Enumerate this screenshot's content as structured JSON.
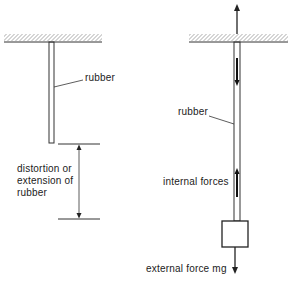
{
  "left_panel": {
    "rubber_label": "rubber",
    "extension_label_lines": [
      "distortion or",
      "extension of",
      "rubber"
    ]
  },
  "right_panel": {
    "rubber_label": "rubber",
    "internal_forces_label": "internal forces",
    "external_force_label": "external force mg"
  },
  "colors": {
    "line": "#333333",
    "background": "#ffffff"
  }
}
